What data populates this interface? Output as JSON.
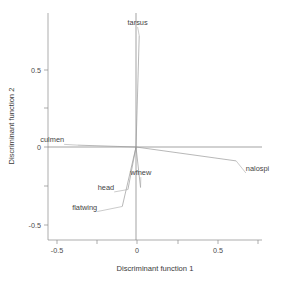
{
  "chart_data": {
    "type": "scatter",
    "title": "",
    "subtitle": "",
    "xlabel": "Discriminant function 1",
    "ylabel": "Discriminant function 2",
    "xlim": [
      -0.62,
      0.78
    ],
    "ylim": [
      -0.62,
      0.9
    ],
    "xticks": [
      -0.5,
      0,
      0.5
    ],
    "xticklabels": [
      "-0.5",
      "0",
      "0.5"
    ],
    "yticks": [
      -0.5,
      0,
      0.5
    ],
    "yticklabels": [
      "-0.5",
      "0",
      "0.5"
    ],
    "grid": false,
    "legend": "none",
    "origin": [
      0,
      0
    ],
    "vectors": [
      {
        "name": "tarsus",
        "x": 0.02,
        "y": 0.72,
        "label": "tarsus",
        "label_x": 0.01,
        "label_y": 0.79
      },
      {
        "name": "nalospi",
        "x": 0.62,
        "y": -0.09,
        "label": "nalospi",
        "label_x": 0.68,
        "label_y": -0.155
      },
      {
        "name": "culmen",
        "x": -0.36,
        "y": 0.012,
        "label": "culmen",
        "label_x": -0.445,
        "label_y": 0.03
      },
      {
        "name": "flatwing",
        "x": -0.085,
        "y": -0.385,
        "label": "flatwing",
        "label_x": -0.24,
        "label_y": -0.405
      },
      {
        "name": "head",
        "x": -0.05,
        "y": -0.275,
        "label": "head",
        "label_x": -0.135,
        "label_y": -0.278
      },
      {
        "name": "wfnew",
        "x": 0.028,
        "y": -0.262,
        "label": "wfnew",
        "label_x": 0.03,
        "label_y": -0.182
      }
    ]
  }
}
